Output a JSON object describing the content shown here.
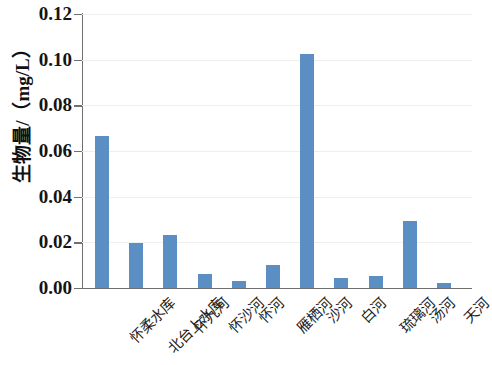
{
  "chart_data": {
    "type": "bar",
    "title": "",
    "subtitle": "",
    "xlabel": "",
    "ylabel": "生物量/（mg/L）",
    "ylim": [
      0.0,
      0.12
    ],
    "ytick_labels": [
      "0.12",
      "0.10",
      "0.08",
      "0.06",
      "0.04",
      "0.02",
      "0.00"
    ],
    "ytick_values": [
      0.12,
      0.1,
      0.08,
      0.06,
      0.04,
      0.02,
      0.0
    ],
    "grid": "horizontal-faint",
    "legend": "none",
    "bar_color": "#5b8fc4",
    "axis_color": "#6f6f6f",
    "gridline_color": "#eceef1",
    "categories": [
      "怀柔水库",
      "北台上水库",
      "怀九河",
      "怀沙河",
      "怀河",
      "雁栖河",
      "沙河",
      "白河",
      "琉璃河",
      "汤河",
      "天河"
    ],
    "values": [
      0.0666,
      0.0197,
      0.0232,
      0.0061,
      0.0031,
      0.0101,
      0.1024,
      0.0044,
      0.0053,
      0.0293,
      0.0022
    ]
  }
}
